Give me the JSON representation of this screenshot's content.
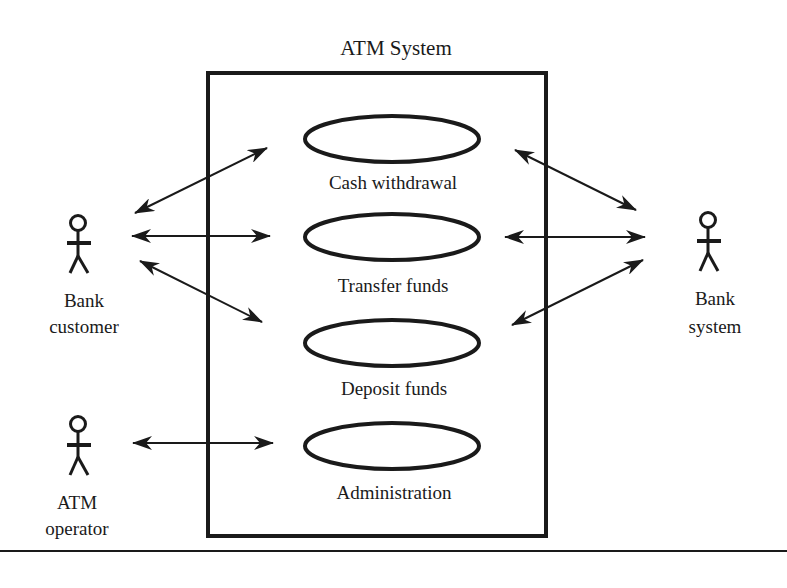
{
  "system": {
    "title": "ATM System"
  },
  "use_cases": [
    {
      "label": "Cash withdrawal"
    },
    {
      "label": "Transfer funds"
    },
    {
      "label": "Deposit funds"
    },
    {
      "label": "Administration"
    }
  ],
  "actors": {
    "bank_customer": {
      "line1": "Bank",
      "line2": "customer"
    },
    "atm_operator": {
      "line1": "ATM",
      "line2": "operator"
    },
    "bank_system": {
      "line1": "Bank",
      "line2": "system"
    }
  },
  "associations": [
    {
      "from": "Bank customer",
      "to": "Cash withdrawal",
      "bidirectional": true
    },
    {
      "from": "Bank customer",
      "to": "Transfer funds",
      "bidirectional": true
    },
    {
      "from": "Bank customer",
      "to": "Deposit funds",
      "bidirectional": true
    },
    {
      "from": "ATM operator",
      "to": "Administration",
      "bidirectional": true
    },
    {
      "from": "Bank system",
      "to": "Cash withdrawal",
      "bidirectional": true
    },
    {
      "from": "Bank system",
      "to": "Transfer funds",
      "bidirectional": true
    },
    {
      "from": "Bank system",
      "to": "Deposit funds",
      "bidirectional": true
    }
  ],
  "colors": {
    "stroke": "#1a1a1a",
    "background": "#ffffff"
  }
}
